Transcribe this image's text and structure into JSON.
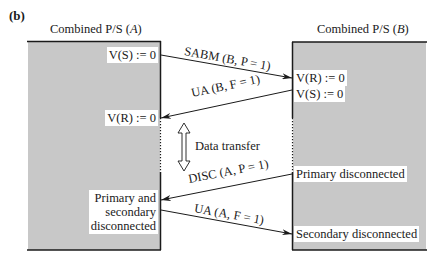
{
  "figure": {
    "label": "(b)",
    "colors": {
      "station_fill": "#c8c8c8",
      "line": "#1a1a1a",
      "background": "#ffffff"
    }
  },
  "stations": [
    {
      "id": "A",
      "title": "Combined P/S (A)",
      "title_text": "Combined P/S (",
      "title_var": "A",
      "title_close": ")",
      "states": [
        {
          "text": "V(S) := 0"
        },
        {
          "text": "V(R) := 0"
        },
        {
          "text": "Primary and secondary disconnected",
          "lines": [
            "Primary and",
            "secondary",
            "disconnected"
          ]
        }
      ]
    },
    {
      "id": "B",
      "title": "Combined P/S (B)",
      "title_text": "Combined P/S (",
      "title_var": "B",
      "title_close": ")",
      "states": [
        {
          "text": "V(R) := 0"
        },
        {
          "text": "V(S) := 0"
        },
        {
          "text": "Primary disconnected"
        },
        {
          "text": "Secondary disconnected"
        }
      ]
    }
  ],
  "messages": [
    {
      "label": "SABM (B, P = 1)",
      "from": "A",
      "to": "B"
    },
    {
      "label": "UA (B, F = 1)",
      "from": "B",
      "to": "A"
    },
    {
      "label": "DISC (A, P = 1)",
      "from": "B",
      "to": "A"
    },
    {
      "label": "UA (A, F = 1)",
      "from": "A",
      "to": "B"
    }
  ],
  "data_transfer": {
    "label": "Data transfer",
    "icon": "double-arrow-vertical-icon"
  }
}
